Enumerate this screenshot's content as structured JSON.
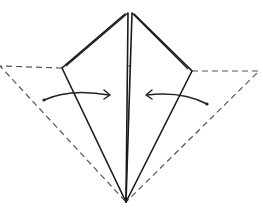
{
  "diagram": {
    "type": "origami-fold-step",
    "elements": {
      "original_square_outline": "dashed",
      "folded_kite": "solid",
      "center_crease": "double-line",
      "fold_arrows": [
        "left-to-center",
        "right-to-center"
      ]
    },
    "colors": {
      "line": "#1a1a1a",
      "dashed": "#555555",
      "background": "#ffffff"
    }
  }
}
